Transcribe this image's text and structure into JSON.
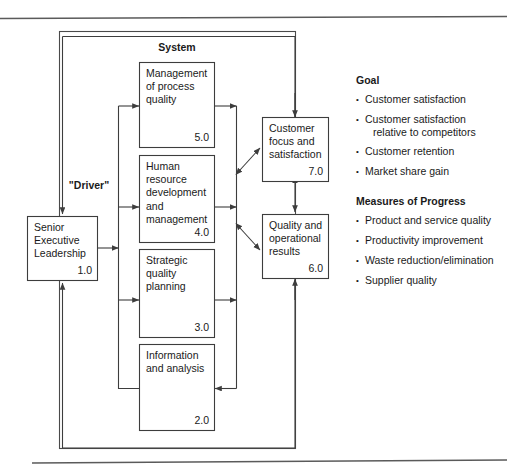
{
  "diagram": {
    "system_label": "System",
    "driver_label": "\"Driver\"",
    "boxes": [
      {
        "id": "box-5",
        "lines": [
          "Management",
          "of process",
          "quality"
        ],
        "number": "5.0"
      },
      {
        "id": "box-4",
        "lines": [
          "Human",
          "resource",
          "development",
          "and",
          "management"
        ],
        "number": "4.0"
      },
      {
        "id": "box-3",
        "lines": [
          "Strategic",
          "quality",
          "planning"
        ],
        "number": "3.0"
      },
      {
        "id": "box-2",
        "lines": [
          "Information",
          "and analysis"
        ],
        "number": "2.0"
      },
      {
        "id": "box-1",
        "lines": [
          "Senior",
          "Executive",
          "Leadership"
        ],
        "number": "1.0"
      },
      {
        "id": "box-7",
        "lines": [
          "Customer",
          "focus and",
          "satisfaction"
        ],
        "number": "7.0"
      },
      {
        "id": "box-6",
        "lines": [
          "Quality and",
          "operational",
          "results"
        ],
        "number": "6.0"
      }
    ]
  },
  "panel": {
    "goal_heading": "Goal",
    "goal_items": [
      [
        "Customer satisfaction"
      ],
      [
        "Customer satisfaction",
        "relative to competitors"
      ],
      [
        "Customer retention"
      ],
      [
        "Market share gain"
      ]
    ],
    "measures_heading": "Measures of Progress",
    "measures_items": [
      [
        "Product and service quality"
      ],
      [
        "Productivity improvement"
      ],
      [
        "Waste reduction/elimination"
      ],
      [
        "Supplier quality"
      ]
    ],
    "bullet": "•"
  }
}
